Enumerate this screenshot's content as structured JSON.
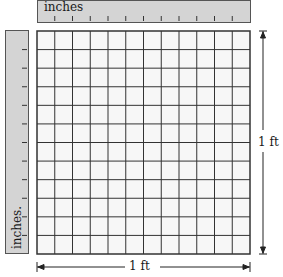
{
  "diagram": {
    "top_ruler": {
      "label": "inches",
      "ticks": 11
    },
    "left_ruler": {
      "label": "inches.",
      "ticks": 11
    },
    "grid": {
      "columns": 12,
      "rows": 12,
      "cell_unit": "1 square inch"
    },
    "dimensions": {
      "width_label": "1 ft",
      "height_label": "1 ft"
    },
    "colors": {
      "ruler_fill": "#d4d4d4",
      "grid_line": "#333333",
      "grid_fill": "#f7f7f7"
    }
  }
}
